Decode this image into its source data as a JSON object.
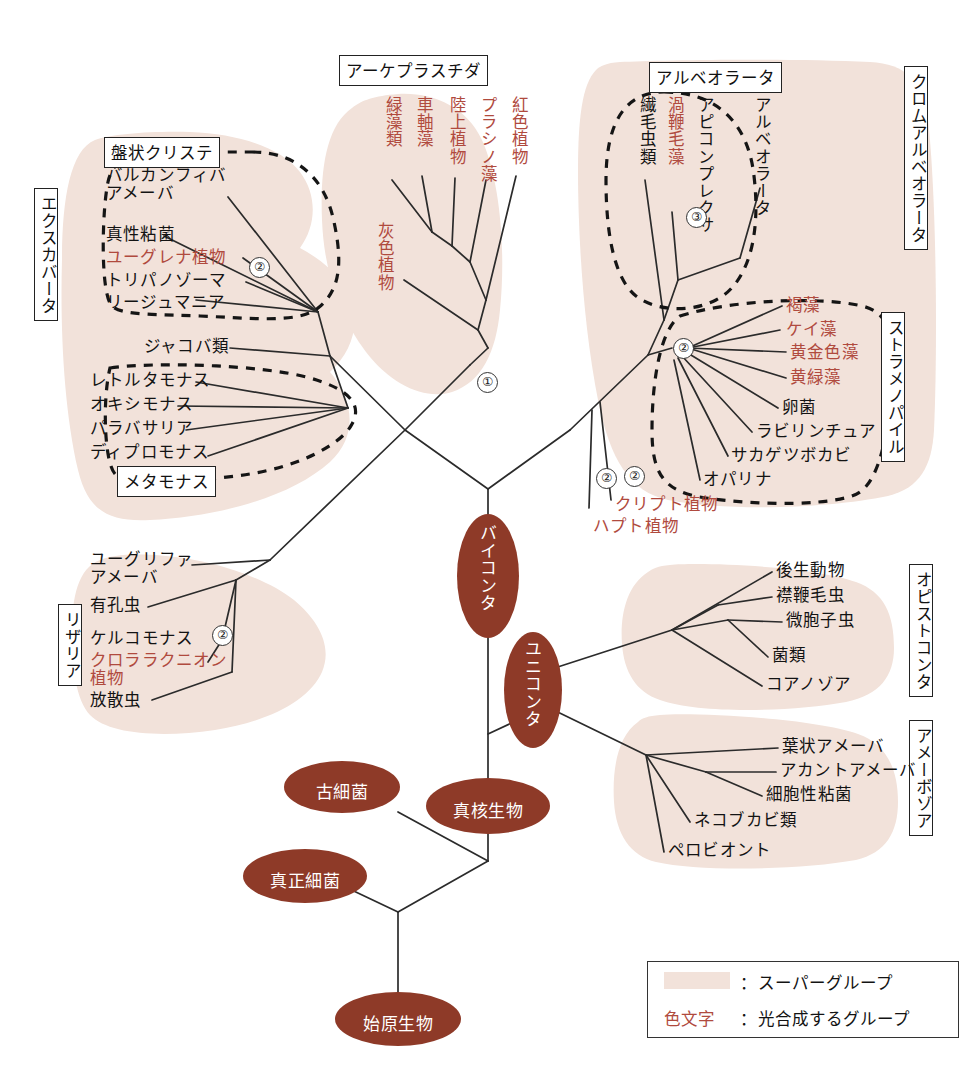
{
  "diagram": {
    "title_present": false,
    "colors": {
      "supergroup_fill": "#f2e2da",
      "clade_ellipse": "#8e3a28",
      "photosynthetic_text": "#b04a3e",
      "branch_line": "#2b2b2b",
      "background": "#ffffff"
    }
  },
  "supergroups": [
    {
      "id": "excavata",
      "label": "エクスカバータ"
    },
    {
      "id": "archaeplastida",
      "label": "アーケプラスチダ"
    },
    {
      "id": "chromalveolata",
      "label": "クロムアルベオラータ"
    },
    {
      "id": "rhizaria",
      "label": "リザリア"
    },
    {
      "id": "opisthokonta",
      "label": "オピストコンタ"
    },
    {
      "id": "amoebozoa",
      "label": "アメーボゾア"
    }
  ],
  "subgroups": [
    {
      "id": "discicristata",
      "label": "盤状クリステ"
    },
    {
      "id": "metamonada",
      "label": "メタモナス"
    },
    {
      "id": "alveolata",
      "label": "アルベオラータ"
    },
    {
      "id": "stramenopiles",
      "label": "ストラメノパイル"
    }
  ],
  "clades": [
    {
      "id": "bikonta",
      "label": "バイコンタ"
    },
    {
      "id": "unikonta",
      "label": "ユニコンタ"
    },
    {
      "id": "eukaryota",
      "label": "真核生物"
    },
    {
      "id": "archaea",
      "label": "古細菌"
    },
    {
      "id": "bacteria",
      "label": "真正細菌"
    },
    {
      "id": "progenote",
      "label": "始原生物"
    }
  ],
  "taxa": {
    "archaeplastida": [
      {
        "label": "緑藻類",
        "photosynthetic": true
      },
      {
        "label": "車軸藻",
        "photosynthetic": true
      },
      {
        "label": "陸上植物",
        "photosynthetic": true
      },
      {
        "label": "プラシノ藻",
        "photosynthetic": true
      },
      {
        "label": "紅色植物",
        "photosynthetic": true
      },
      {
        "label": "灰色植物",
        "photosynthetic": true
      }
    ],
    "excavata_discicristata": [
      {
        "label": "バルカンフィバ\nアメーバ",
        "photosynthetic": false
      },
      {
        "label": "真性粘菌",
        "photosynthetic": false
      },
      {
        "label": "ユーグレナ植物",
        "photosynthetic": true
      },
      {
        "label": "トリパノゾーマ",
        "photosynthetic": false
      },
      {
        "label": "リージュマニア",
        "photosynthetic": false
      }
    ],
    "excavata_other": [
      {
        "label": "ジャコバ類",
        "photosynthetic": false
      }
    ],
    "excavata_metamonada": [
      {
        "label": "レトルタモナス",
        "photosynthetic": false
      },
      {
        "label": "オキシモナス",
        "photosynthetic": false
      },
      {
        "label": "パラバサリア",
        "photosynthetic": false
      },
      {
        "label": "ディプロモナス",
        "photosynthetic": false
      }
    ],
    "rhizaria": [
      {
        "label": "ユーグリファ\nアメーバ",
        "photosynthetic": false
      },
      {
        "label": "有孔虫",
        "photosynthetic": false
      },
      {
        "label": "ケルコモナス",
        "photosynthetic": false
      },
      {
        "label": "クロララクニオン\n植物",
        "photosynthetic": true
      },
      {
        "label": "放散虫",
        "photosynthetic": false
      }
    ],
    "alveolata": [
      {
        "label": "繊毛虫類",
        "photosynthetic": false
      },
      {
        "label": "渦鞭毛藻",
        "photosynthetic": true
      },
      {
        "label": "アピコンプレクサ",
        "photosynthetic": false
      }
    ],
    "alveolata_group_label": "アルベオラータ",
    "stramenopiles": [
      {
        "label": "褐藻",
        "photosynthetic": true
      },
      {
        "label": "ケイ藻",
        "photosynthetic": true
      },
      {
        "label": "黄金色藻",
        "photosynthetic": true
      },
      {
        "label": "黄緑藻",
        "photosynthetic": true
      },
      {
        "label": "卵菌",
        "photosynthetic": false
      },
      {
        "label": "ラビリンチュア",
        "photosynthetic": false
      },
      {
        "label": "サカゲツボカビ",
        "photosynthetic": false
      },
      {
        "label": "オパリナ",
        "photosynthetic": false
      }
    ],
    "chromalveolata_other": [
      {
        "label": "クリプト植物",
        "photosynthetic": true
      },
      {
        "label": "ハプト植物",
        "photosynthetic": true
      }
    ],
    "opisthokonta": [
      {
        "label": "後生動物",
        "photosynthetic": false
      },
      {
        "label": "襟鞭毛虫",
        "photosynthetic": false
      },
      {
        "label": "微胞子虫",
        "photosynthetic": false
      },
      {
        "label": "菌類",
        "photosynthetic": false
      },
      {
        "label": "コアノゾア",
        "photosynthetic": false
      }
    ],
    "amoebozoa": [
      {
        "label": "葉状アメーバ",
        "photosynthetic": false
      },
      {
        "label": "アカントアメーバ",
        "photosynthetic": false
      },
      {
        "label": "細胞性粘菌",
        "photosynthetic": false
      },
      {
        "label": "ネコブカビ類",
        "photosynthetic": false
      },
      {
        "label": "ペロビオント",
        "photosynthetic": false
      }
    ]
  },
  "event_markers": [
    {
      "id": "m1",
      "label": "①"
    },
    {
      "id": "m2-excavata",
      "label": "②"
    },
    {
      "id": "m2-rhizaria",
      "label": "②"
    },
    {
      "id": "m3-alveolata",
      "label": "③"
    },
    {
      "id": "m2-stramenopiles",
      "label": "②"
    },
    {
      "id": "m2-cryptophyte",
      "label": "②"
    },
    {
      "id": "m2-haptophyte",
      "label": "②"
    }
  ],
  "legend": {
    "row1_separator": "：",
    "row1_text": "スーパーグループ",
    "row2_key": "色文字",
    "row2_separator": "：",
    "row2_text": "光合成するグループ"
  }
}
